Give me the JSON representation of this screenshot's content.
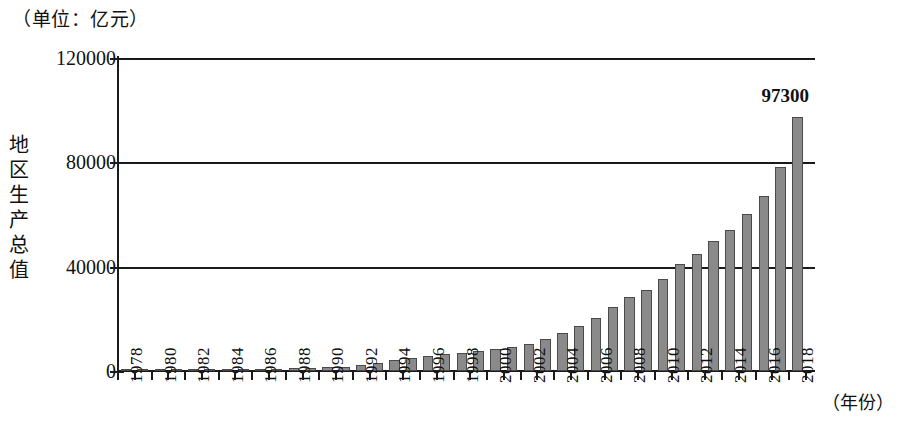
{
  "unit_caption": "（单位：亿元）",
  "y_axis_title_chars": [
    "地",
    "区",
    "生",
    "产",
    "总",
    "值"
  ],
  "y_axis_title": "地区生产总值",
  "x_axis_title": "（年份）",
  "highlight_label": "97300",
  "colors": {
    "bar_fill": "#8a8a8a",
    "bar_stroke": "#4a4a4a",
    "axis": "#1a1a1a",
    "background": "#ffffff"
  },
  "chart_data": {
    "type": "bar",
    "title": "（单位：亿元）",
    "xlabel": "（年份）",
    "ylabel": "地区生产总值",
    "unit": "亿元",
    "ylim": [
      0,
      120000
    ],
    "ytick_labels": [
      "0",
      "40000",
      "80000",
      "120000"
    ],
    "ytick_values": [
      0,
      40000,
      80000,
      120000
    ],
    "grid": true,
    "legend": "none",
    "annotations": [
      {
        "x": "2018",
        "value": 97300,
        "text": "97300"
      }
    ],
    "categories": [
      "1978",
      "1979",
      "1980",
      "1981",
      "1982",
      "1983",
      "1984",
      "1985",
      "1986",
      "1987",
      "1988",
      "1989",
      "1990",
      "1991",
      "1992",
      "1993",
      "1994",
      "1995",
      "1996",
      "1997",
      "1998",
      "1999",
      "2000",
      "2001",
      "2002",
      "2003",
      "2004",
      "2005",
      "2006",
      "2007",
      "2008",
      "2009",
      "2010",
      "2011",
      "2012",
      "2013",
      "2014",
      "2015",
      "2016",
      "2017",
      "2018"
    ],
    "xtick_labels_shown": [
      "1978",
      "1980",
      "1982",
      "1984",
      "1986",
      "1988",
      "1990",
      "1992",
      "1994",
      "1996",
      "1998",
      "2000",
      "2002",
      "2004",
      "2006",
      "2008",
      "2010",
      "2012",
      "2014",
      "2016",
      "2018"
    ],
    "values": [
      185,
      210,
      250,
      280,
      320,
      380,
      470,
      590,
      680,
      830,
      1100,
      1250,
      1400,
      1700,
      2200,
      3000,
      4200,
      5100,
      5900,
      6500,
      7000,
      7500,
      8300,
      9200,
      10300,
      12100,
      14500,
      17100,
      20300,
      24600,
      28500,
      31000,
      35200,
      41000,
      45000,
      49800,
      54000,
      60300,
      67000,
      78100,
      97300
    ]
  }
}
